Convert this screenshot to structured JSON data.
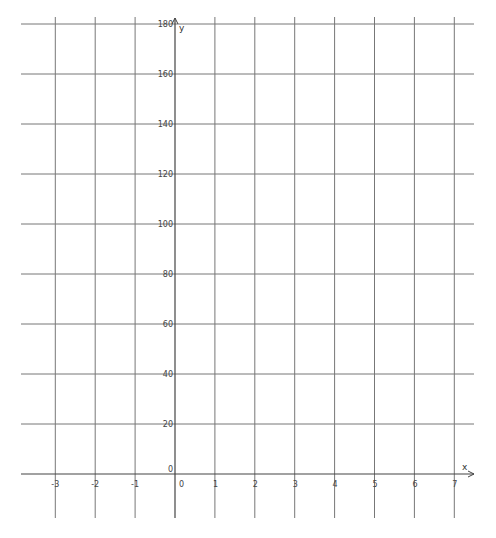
{
  "chart_data": {
    "type": "line",
    "title": "",
    "xlabel": "x",
    "ylabel": "y",
    "xlim": [
      -3.5,
      7.5
    ],
    "ylim": [
      0,
      180
    ],
    "grid": true,
    "x_ticks": [
      -3,
      -2,
      -1,
      0,
      1,
      2,
      3,
      4,
      5,
      6,
      7
    ],
    "y_ticks": [
      0,
      20,
      40,
      60,
      80,
      100,
      120,
      140,
      160,
      180
    ],
    "x_tick_labels": [
      "-3",
      "-2",
      "-1",
      "0",
      "1",
      "2",
      "3",
      "4",
      "5",
      "6",
      "7"
    ],
    "y_tick_labels": [
      "0",
      "20",
      "40",
      "60",
      "80",
      "100",
      "120",
      "140",
      "160",
      "180"
    ],
    "series": [],
    "legend": null
  },
  "axes": {
    "x_name": "x",
    "y_name": "y",
    "origin_label": "0"
  }
}
